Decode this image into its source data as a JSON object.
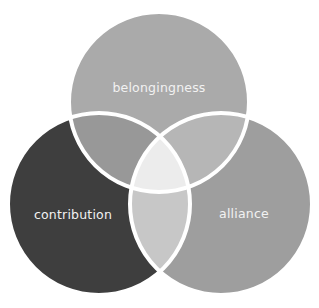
{
  "diagram": {
    "type": "venn-3",
    "background": "#ffffff",
    "stroke_color": "#ffffff",
    "stroke_width": 4,
    "circles": [
      {
        "id": "top",
        "label": "belongingness",
        "cx": 159,
        "cy": 102,
        "r": 90,
        "fill": "#aaaaaa",
        "label_x": 159,
        "label_y": 92
      },
      {
        "id": "left",
        "label": "contribution",
        "cx": 99,
        "cy": 204,
        "r": 91,
        "fill": "#3e3e3e",
        "label_x": 73,
        "label_y": 219
      },
      {
        "id": "right",
        "label": "alliance",
        "cx": 221,
        "cy": 204,
        "r": 91,
        "fill": "#9e9e9e",
        "label_x": 244,
        "label_y": 218
      }
    ],
    "overlaps": {
      "top_left": {
        "fill": "#989898"
      },
      "top_right": {
        "fill": "#b6b6b6"
      },
      "left_right": {
        "fill": "#c7c7c7"
      },
      "center": {
        "fill": "#ececec"
      }
    }
  }
}
